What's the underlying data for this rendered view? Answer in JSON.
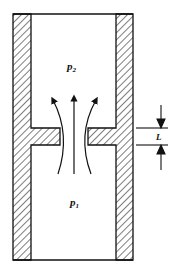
{
  "diagram": {
    "type": "orifice-flow-schematic",
    "labels": {
      "upper_pressure": "p",
      "upper_pressure_sub": "2",
      "lower_pressure": "p",
      "lower_pressure_sub": "1",
      "thickness": "L"
    },
    "colors": {
      "stroke": "#111111",
      "background": "#ffffff"
    }
  }
}
